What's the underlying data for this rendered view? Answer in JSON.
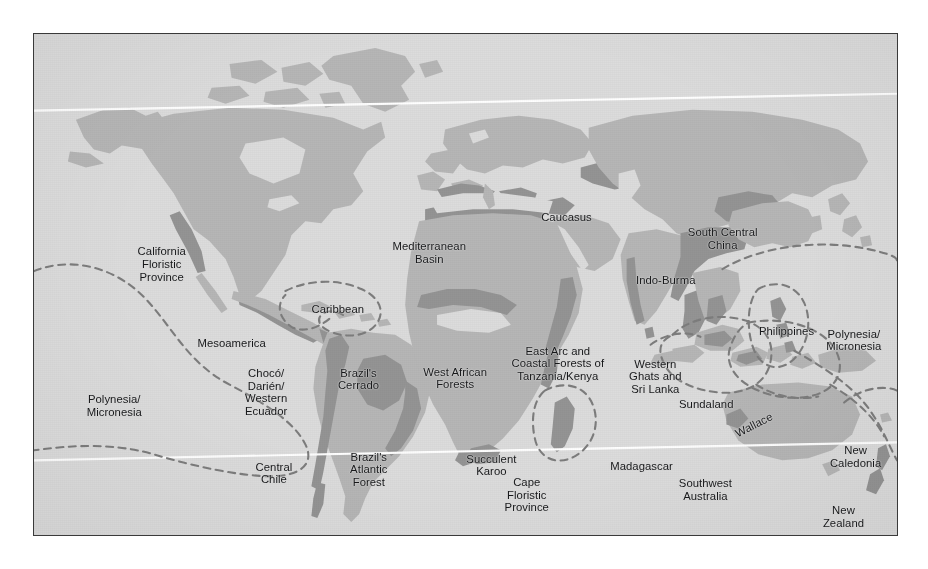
{
  "figure": {
    "kind": "world-map",
    "title": "",
    "frame": {
      "border_color": "#3a3a3a",
      "background_color": "#dcdcdc"
    }
  },
  "legend_colors": {
    "ocean": "#dcdcdc",
    "land": "#b4b4b4",
    "hotspot": "#8f8f8f",
    "dashed_boundary": "#7a7a7a",
    "latitude_line": "#ffffff",
    "label_text": "#17181a"
  },
  "graticule": {
    "lines": [
      {
        "name": "tropic-of-cancer",
        "color": "#ffffff"
      },
      {
        "name": "tropic-of-capricorn",
        "color": "#ffffff"
      }
    ]
  },
  "hotspots": [
    {
      "id": "california-floristic-province",
      "label": "California\nFloristic\nProvince",
      "x": 14.8,
      "y": 46.0,
      "marker": "land-shading"
    },
    {
      "id": "caribbean",
      "label": "Caribbean",
      "x": 35.2,
      "y": 54.8,
      "marker": "dashed-outline"
    },
    {
      "id": "mesoamerica",
      "label": "Mesoamerica",
      "x": 22.9,
      "y": 61.6,
      "marker": "land-shading"
    },
    {
      "id": "choco-darien-western-ecuador",
      "label": "Chocó/\nDarién/\nWestern\nEcuador",
      "x": 26.9,
      "y": 71.5,
      "marker": "land-shading"
    },
    {
      "id": "brazils-cerrado",
      "label": "Brazil's\nCerrado",
      "x": 37.6,
      "y": 69.0,
      "marker": "land-shading"
    },
    {
      "id": "brazils-atlantic-forest",
      "label": "Brazil's\nAtlantic\nForest",
      "x": 38.8,
      "y": 87.0,
      "marker": "land-shading"
    },
    {
      "id": "central-chile",
      "label": "Central\nChile",
      "x": 27.8,
      "y": 87.8,
      "marker": "land-shading"
    },
    {
      "id": "polynesia-micronesia-east",
      "label": "Polynesia/\nMicronesia",
      "x": 9.3,
      "y": 74.3,
      "marker": "dashed-outline"
    },
    {
      "id": "mediterranean-basin",
      "label": "Mediterranean\nBasin",
      "x": 45.8,
      "y": 43.8,
      "marker": "land-shading"
    },
    {
      "id": "caucasus",
      "label": "Caucasus",
      "x": 61.7,
      "y": 36.5,
      "marker": "land-shading"
    },
    {
      "id": "west-african-forests",
      "label": "West African\nForests",
      "x": 48.8,
      "y": 68.8,
      "marker": "land-shading"
    },
    {
      "id": "east-arc-coastal-forests",
      "label": "East Arc and\nCoastal Forests of\nTanzania/Kenya",
      "x": 60.7,
      "y": 65.8,
      "marker": "land-shading"
    },
    {
      "id": "succulent-karoo",
      "label": "Succulent\nKaroo",
      "x": 53.0,
      "y": 86.2,
      "marker": "land-shading"
    },
    {
      "id": "cape-floristic-province",
      "label": "Cape\nFloristic\nProvince",
      "x": 57.1,
      "y": 92.0,
      "marker": "land-shading"
    },
    {
      "id": "madagascar",
      "label": "Madagascar",
      "x": 70.4,
      "y": 86.3,
      "marker": "dashed-outline"
    },
    {
      "id": "western-ghats-sri-lanka",
      "label": "Western\nGhats and\nSri Lanka",
      "x": 72.0,
      "y": 68.4,
      "marker": "land-shading"
    },
    {
      "id": "indo-burma",
      "label": "Indo-Burma",
      "x": 73.2,
      "y": 49.2,
      "marker": "land-shading"
    },
    {
      "id": "south-central-china",
      "label": "South Central\nChina",
      "x": 79.8,
      "y": 41.0,
      "marker": "land-shading"
    },
    {
      "id": "philippines",
      "label": "Philippines",
      "x": 87.2,
      "y": 59.3,
      "marker": "dashed-outline"
    },
    {
      "id": "sundaland",
      "label": "Sundaland",
      "x": 77.9,
      "y": 73.8,
      "marker": "dashed-outline"
    },
    {
      "id": "wallacea",
      "label": "Wallace",
      "x": 83.4,
      "y": 78.1,
      "marker": "dashed-outline",
      "rotated": true
    },
    {
      "id": "polynesia-micronesia-west",
      "label": "Polynesia/\nMicronesia",
      "x": 95.0,
      "y": 61.2,
      "marker": "dashed-outline"
    },
    {
      "id": "new-caledonia",
      "label": "New\nCaledonia",
      "x": 95.2,
      "y": 84.5,
      "marker": "dashed-outline"
    },
    {
      "id": "new-zealand",
      "label": "New\nZealand",
      "x": 93.8,
      "y": 96.5,
      "marker": "land-shading"
    },
    {
      "id": "southwest-australia",
      "label": "Southwest\nAustralia",
      "x": 77.8,
      "y": 91.0,
      "marker": "land-shading"
    }
  ]
}
